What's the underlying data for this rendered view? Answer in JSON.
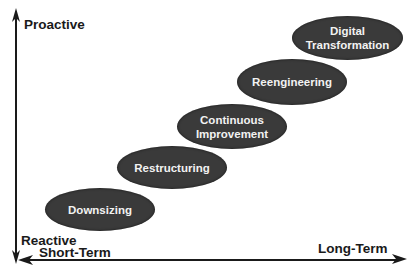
{
  "diagram": {
    "y_axis": {
      "top_label": "Proactive",
      "bottom_label": "Reactive"
    },
    "x_axis": {
      "left_label": "Short-Term",
      "right_label": "Long-Term"
    },
    "stages": [
      {
        "line1": "Downsizing",
        "line2": ""
      },
      {
        "line1": "Restructuring",
        "line2": ""
      },
      {
        "line1": "Continuous",
        "line2": "Improvement"
      },
      {
        "line1": "Reengineering",
        "line2": ""
      },
      {
        "line1": "Digital",
        "line2": "Transformation"
      }
    ],
    "colors": {
      "stage_fill": "#3a3a3a",
      "stage_text": "#f2f2f2",
      "axis": "#1a1a1a",
      "background": "#ffffff"
    }
  }
}
